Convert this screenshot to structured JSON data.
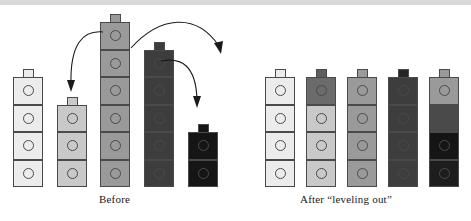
{
  "figure": {
    "title_before": "Before",
    "title_after": "After “leveling out”",
    "background_color": "#ffffff",
    "outline_color": "#4a4a4a",
    "top_band_color": "#d9d9d9"
  },
  "palette": {
    "lightest": "#ececec",
    "light": "#c9c9c9",
    "medium": "#9a9a9a",
    "dark": "#4a4a4a",
    "darkest": "#151515"
  },
  "geometry": {
    "cell_width": 30,
    "cell_height": 27.5,
    "tab_width": 11,
    "tab_height": 8,
    "knob_diameter": 11,
    "baseline_y": 187
  },
  "before": {
    "label": "Before",
    "label_x": 99,
    "label_y": 193,
    "stacks": [
      {
        "name": "stack-1",
        "x": 13,
        "count": 4,
        "color": "#ececec",
        "cell_colors": [
          "#ececec",
          "#ececec",
          "#ececec",
          "#ececec"
        ]
      },
      {
        "name": "stack-2",
        "x": 57,
        "count": 3,
        "color": "#c9c9c9",
        "cell_colors": [
          "#c9c9c9",
          "#c9c9c9",
          "#c9c9c9"
        ]
      },
      {
        "name": "stack-3",
        "x": 100,
        "count": 6,
        "color": "#9a9a9a",
        "cell_colors": [
          "#9a9a9a",
          "#9a9a9a",
          "#9a9a9a",
          "#9a9a9a",
          "#9a9a9a",
          "#9a9a9a"
        ]
      },
      {
        "name": "stack-4",
        "x": 144,
        "count": 5,
        "color": "#3d3d3d",
        "cell_colors": [
          "#3d3d3d",
          "#3d3d3d",
          "#3d3d3d",
          "#3d3d3d",
          "#3d3d3d"
        ]
      },
      {
        "name": "stack-5",
        "x": 188,
        "count": 2,
        "color": "#151515",
        "cell_colors": [
          "#151515",
          "#151515"
        ]
      }
    ]
  },
  "after": {
    "label": "After “leveling out”",
    "label_x": 300,
    "label_y": 193,
    "stacks": [
      {
        "name": "stack-1",
        "x": 265,
        "count": 4,
        "tab_color": "#ececec",
        "cell_colors": [
          "#ececec",
          "#ececec",
          "#ececec",
          "#ececec"
        ]
      },
      {
        "name": "stack-2",
        "x": 306,
        "count": 4,
        "tab_color": "#5e5e5e",
        "cell_colors": [
          "#6b6b6b",
          "#c9c9c9",
          "#c9c9c9",
          "#c9c9c9"
        ]
      },
      {
        "name": "stack-3",
        "x": 347,
        "count": 4,
        "tab_color": "#9a9a9a",
        "cell_colors": [
          "#9a9a9a",
          "#9a9a9a",
          "#9a9a9a",
          "#9a9a9a"
        ]
      },
      {
        "name": "stack-4",
        "x": 388,
        "count": 4,
        "tab_color": "#262626",
        "cell_colors": [
          "#3d3d3d",
          "#3d3d3d",
          "#3d3d3d",
          "#3d3d3d"
        ]
      },
      {
        "name": "stack-5",
        "x": 429,
        "count": 4,
        "tab_color": "#9a9a9a",
        "cell_colors": [
          "#9a9a9a",
          "#4a4a4a",
          "#151515",
          "#1d1d1d"
        ]
      }
    ]
  },
  "arrows": [
    {
      "name": "arrow-stack3-to-stack2",
      "path": "M 103 32 C 83 30 70 44 71 84",
      "head": "M 71 92 L 67 80 L 75 80 Z"
    },
    {
      "name": "arrow-stack3-to-right",
      "path": "M 131 48 C 160 16 196 12 219 46",
      "head": "M 221 54 L 214 43 L 223 41 Z"
    },
    {
      "name": "arrow-stack4-to-stack5",
      "path": "M 161 61 C 182 57 196 66 197 100",
      "head": "M 197 108 L 193 96 L 201 96 Z"
    }
  ]
}
